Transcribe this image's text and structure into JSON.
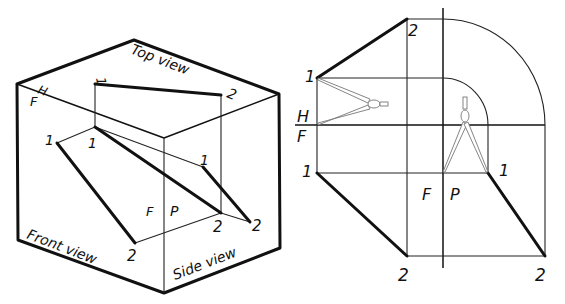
{
  "figure": {
    "left_panel": {
      "description": "Glass-box isometric projection of line 1-2",
      "view_labels": {
        "top": "Top view",
        "front": "Front view",
        "side": "Side view"
      },
      "fold_labels": {
        "h": "H",
        "f_top": "F",
        "f_side": "F",
        "p": "P"
      },
      "point_labels": {
        "top_1": "1",
        "top_2": "2",
        "front_1": "1",
        "front_2": "2",
        "inner_1": "1",
        "inner_2": "2",
        "side_1": "1",
        "side_2": "2"
      }
    },
    "right_panel": {
      "description": "Orthographic projection of line 1-2 with compass transfer arcs",
      "fold_labels": {
        "h": "H",
        "f_left": "F",
        "f_bottom": "F",
        "p": "P"
      },
      "point_labels": {
        "top_1": "1",
        "top_2": "2",
        "front_1": "1",
        "front_2": "2",
        "side_1": "1",
        "side_2": "2"
      },
      "icons": [
        "compass-icon-horizontal",
        "compass-icon-vertical"
      ]
    }
  }
}
